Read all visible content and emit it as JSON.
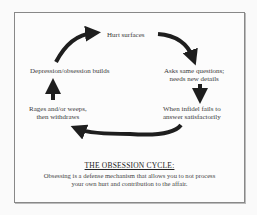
{
  "diagram": {
    "type": "cycle",
    "nodes": [
      {
        "id": "hurt",
        "label": "Hurt surfaces"
      },
      {
        "id": "asks",
        "label_lines": [
          "Asks same questions;",
          "needs new details"
        ]
      },
      {
        "id": "fails",
        "label_lines": [
          "When infidel fails to",
          "answer satisfactorily"
        ]
      },
      {
        "id": "rages",
        "label_lines": [
          "Rages and/or weeps,",
          "then withdraws"
        ]
      },
      {
        "id": "depression",
        "label": "Depression/obsession builds"
      }
    ],
    "edges": [
      {
        "from": "hurt",
        "to": "asks"
      },
      {
        "from": "asks",
        "to": "fails"
      },
      {
        "from": "fails",
        "to": "rages"
      },
      {
        "from": "rages",
        "to": "depression"
      },
      {
        "from": "depression",
        "to": "hurt"
      }
    ],
    "title": "THE OBSESSION CYCLE:",
    "caption_lines": [
      "Obsessing is a defense mechanism that allows you to not process",
      "your own hurt and contribution to the affair."
    ],
    "colors": {
      "arrow": "#1e1e1e",
      "frame": "#888888",
      "text": "#333333"
    }
  }
}
